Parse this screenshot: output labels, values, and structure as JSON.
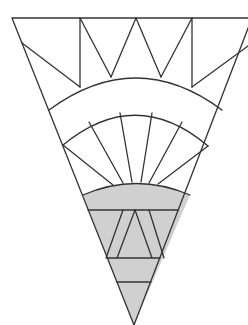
{
  "diagram": {
    "type": "geometric-pattern",
    "colors": {
      "line": "#333333",
      "background": "#ffffff",
      "shaded": "#d0d0d0"
    },
    "regions": [
      {
        "name": "crown",
        "shape": "triangles",
        "shaded": false
      },
      {
        "name": "arch-band",
        "shape": "arc band",
        "shaded": false
      },
      {
        "name": "ray-fan",
        "shape": "wedges",
        "count": 7,
        "shaded": false
      },
      {
        "name": "shaded-cap",
        "shape": "arc segment",
        "shaded": true
      },
      {
        "name": "shaded-triangle-row",
        "shape": "trapezoid with inner triangle",
        "shaded": true
      },
      {
        "name": "shaded-band-1",
        "shape": "trapezoid",
        "shaded": true
      },
      {
        "name": "shaded-tip",
        "shape": "triangle",
        "shaded": true
      }
    ]
  }
}
